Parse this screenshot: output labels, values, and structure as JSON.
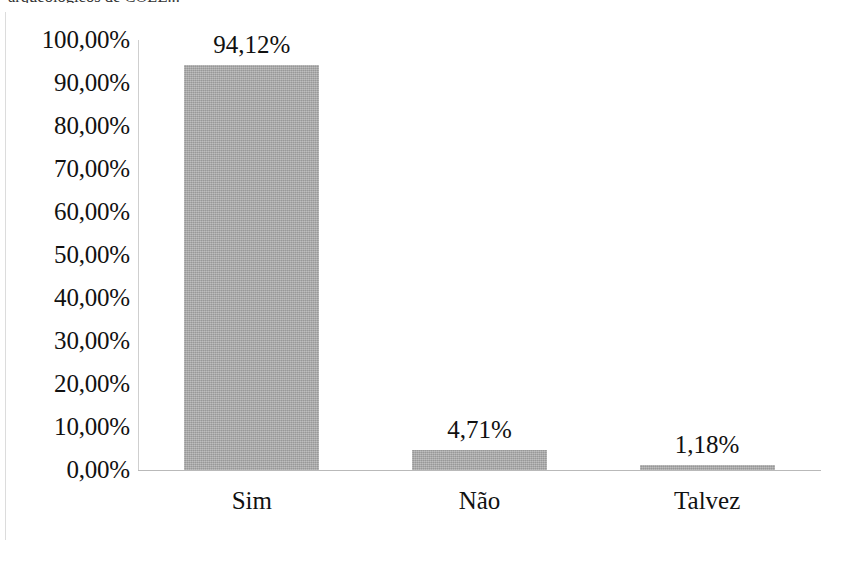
{
  "caption": {
    "clipped_text": "arqueológicos de COLE..."
  },
  "chart_data": {
    "type": "bar",
    "title": "",
    "subtitle": "",
    "xlabel": "",
    "ylabel": "",
    "categories": [
      "Sim",
      "Não",
      "Talvez"
    ],
    "values": [
      94.12,
      4.71,
      1.18
    ],
    "value_labels": [
      "94,12%",
      "4,71%",
      "1,18%"
    ],
    "ylim": [
      0,
      100
    ],
    "ytick_values": [
      100,
      90,
      80,
      70,
      60,
      50,
      40,
      30,
      20,
      10,
      0
    ],
    "ytick_labels": [
      "100,00%",
      "90,00%",
      "80,00%",
      "70,00%",
      "60,00%",
      "50,00%",
      "40,00%",
      "30,00%",
      "20,00%",
      "10,00%",
      "0,00%"
    ],
    "grid": false,
    "legend": false,
    "legend_position": "none",
    "bar_color": "#a6a6a6",
    "axis_color": "#bfbfbf",
    "text_color": "#111111"
  }
}
